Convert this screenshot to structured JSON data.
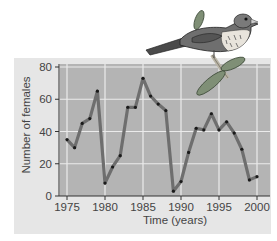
{
  "chart_data": {
    "type": "line",
    "title": "",
    "xlabel": "Time (years)",
    "ylabel": "Number of females",
    "x": [
      1975,
      1976,
      1977,
      1978,
      1979,
      1980,
      1981,
      1982,
      1983,
      1984,
      1985,
      1986,
      1987,
      1988,
      1989,
      1990,
      1991,
      1992,
      1993,
      1994,
      1995,
      1996,
      1997,
      1998,
      1999,
      2000
    ],
    "series": [
      {
        "name": "Number of females",
        "values": [
          35,
          30,
          45,
          48,
          65,
          8,
          18,
          25,
          55,
          55,
          73,
          62,
          57,
          53,
          3,
          9,
          27,
          42,
          41,
          51,
          41,
          46,
          39,
          29,
          10,
          12
        ]
      }
    ],
    "xticks": [
      "1975",
      "1980",
      "1985",
      "1990",
      "1995",
      "2000"
    ],
    "yticks": [
      "0",
      "20",
      "40",
      "60",
      "80"
    ],
    "xlim": [
      1974,
      2001.5
    ],
    "ylim": [
      0,
      80
    ],
    "grid": true,
    "legend": "none",
    "illustration": "song sparrow perched on a leafy twig, upper right"
  },
  "colors": {
    "panel": "#e6e6e6",
    "plot_bg": "#b4b4b4",
    "grid": "#ebebeb",
    "line": "#6e6e6e",
    "marker": "#1a1a1a",
    "text": "#444444",
    "leaf": "#7f8f76"
  }
}
